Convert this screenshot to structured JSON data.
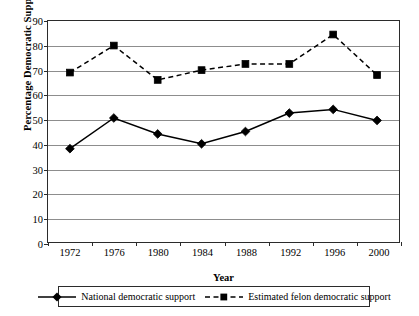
{
  "chart_data": {
    "type": "line",
    "title": "",
    "xlabel": "Year",
    "ylabel": "Percentage Democratic Support",
    "categories": [
      "1972",
      "1976",
      "1980",
      "1984",
      "1988",
      "1992",
      "1996",
      "2000"
    ],
    "x": [
      1972,
      1976,
      1980,
      1984,
      1988,
      1992,
      1996,
      2000
    ],
    "ylim": [
      0,
      90
    ],
    "yticks": [
      0,
      10,
      20,
      30,
      40,
      50,
      60,
      70,
      80,
      90
    ],
    "grid": "horizontal",
    "legend_position": "below-axis",
    "series": [
      {
        "name": "National democratic support",
        "values": [
          38,
          50.5,
          44,
          40,
          45,
          52.5,
          54,
          49.5
        ],
        "marker": "diamond",
        "linestyle": "solid",
        "color": "#000000"
      },
      {
        "name": "Estimated felon democratic support",
        "values": [
          69,
          80,
          66,
          70,
          72.5,
          72.5,
          84.5,
          68
        ],
        "marker": "square",
        "linestyle": "dashed",
        "color": "#000000"
      }
    ]
  },
  "axes": {
    "y_title": "Percentage Democratic Support",
    "x_title": "Year",
    "y_tick_labels": [
      "90",
      "80",
      "70",
      "60",
      "50",
      "40",
      "30",
      "20",
      "10",
      "0"
    ],
    "x_tick_labels": [
      "1972",
      "1976",
      "1980",
      "1984",
      "1988",
      "1992",
      "1996",
      "2000"
    ]
  },
  "legend": {
    "entries": [
      {
        "label": "National democratic support",
        "marker": "diamond-marker",
        "style": "solid"
      },
      {
        "label": "Estimated felon democratic support",
        "marker": "square-marker",
        "style": "dashed"
      }
    ]
  },
  "colors": {
    "line": "#000000",
    "grid": "#8d8d8d",
    "frame": "#2b2b2b",
    "background": "#ffffff"
  }
}
